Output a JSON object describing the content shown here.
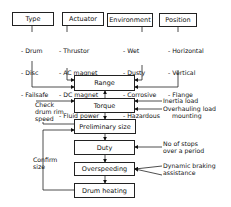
{
  "categories": [
    {
      "label": "Type",
      "items": [
        "- Drum",
        "- Disc",
        "- Failsafe"
      ]
    },
    {
      "label": "Actuator",
      "items": [
        "- Thrustor",
        "- AC magnet",
        "- DC magnet",
        "- Fluid power"
      ]
    },
    {
      "label": "Environment",
      "items": [
        "- Wet",
        "- Dusty",
        "- Corrosive",
        "- Hazardous"
      ]
    },
    {
      "label": "Position",
      "items": [
        "- Horizontal",
        "- Vertical",
        "- Flange",
        "  mounting"
      ]
    }
  ],
  "flow": {
    "range": "Range",
    "torque": "Torque",
    "preliminary_size": "Preliminary size",
    "duty": "Duty",
    "overspeeding": "Overspeeding",
    "drum_heating": "Drum heating"
  },
  "inputs": {
    "inertia_load": "Inertia load",
    "overhauling_load": "Overhauling load",
    "stops": "No of stops\nover a period",
    "dynamic_braking": "Dynamic braking\nassistance"
  },
  "feedback": {
    "check_drum": "Check\ndrum rim\nspeed",
    "confirm_size": "Confirm\nsize"
  }
}
